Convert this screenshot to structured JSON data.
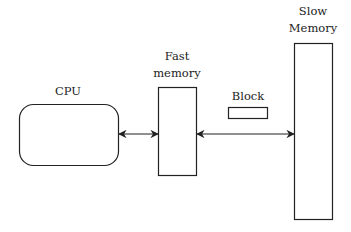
{
  "diagram": {
    "type": "memory-hierarchy",
    "nodes": {
      "cpu": {
        "label": "CPU"
      },
      "fast_memory": {
        "label_line1": "Fast",
        "label_line2": "memory"
      },
      "block": {
        "label": "Block"
      },
      "slow_memory": {
        "label_line1": "Slow",
        "label_line2": "Memory"
      }
    },
    "edges": [
      {
        "from": "CPU",
        "to": "Fast memory",
        "direction": "bidirectional"
      },
      {
        "from": "Fast memory",
        "to": "Slow Memory",
        "direction": "bidirectional"
      }
    ],
    "colors": {
      "stroke": "#222222",
      "background": "#ffffff"
    }
  }
}
